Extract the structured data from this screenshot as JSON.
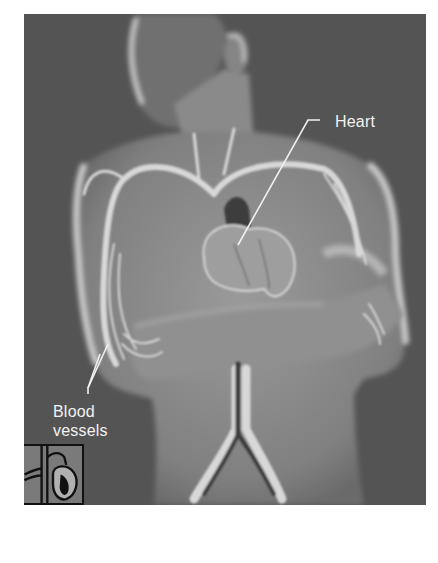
{
  "figure": {
    "background_color": "#545454",
    "body_color": "#8c8c8c",
    "vessel_color": "#d8d8d8",
    "label_color": "#f2f2f2"
  },
  "labels": {
    "heart": "Heart",
    "blood_vessels_line1": "Blood",
    "blood_vessels_line2": "vessels"
  },
  "inset": {
    "icon": "heart-diagram-icon"
  }
}
